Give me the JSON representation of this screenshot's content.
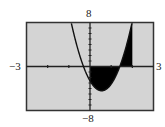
{
  "chart_data": {
    "type": "line",
    "title": "",
    "xlabel": "",
    "ylabel": "",
    "xlim": [
      -3,
      3
    ],
    "ylim": [
      -8,
      8
    ],
    "x_tick_labels": {
      "min": "−3",
      "max": "3"
    },
    "y_tick_labels": {
      "min": "−8",
      "max": "8"
    },
    "x_ticks_step": 1,
    "y_ticks_step": 1,
    "grid": false,
    "series": [
      {
        "name": "parabola",
        "function": "6x^2 - 6.6x - 2.6",
        "coeffs": {
          "a": 6,
          "b": -6.6,
          "c": -2.6
        }
      }
    ],
    "shaded_region": {
      "between": [
        "curve",
        "x-axis"
      ],
      "x_from": 0,
      "x_to": 2,
      "color": "#000000"
    },
    "colors": {
      "background": "#d4d4d4",
      "frame": "#333333",
      "curve": "#111111",
      "fill": "#0a0a0a"
    }
  }
}
